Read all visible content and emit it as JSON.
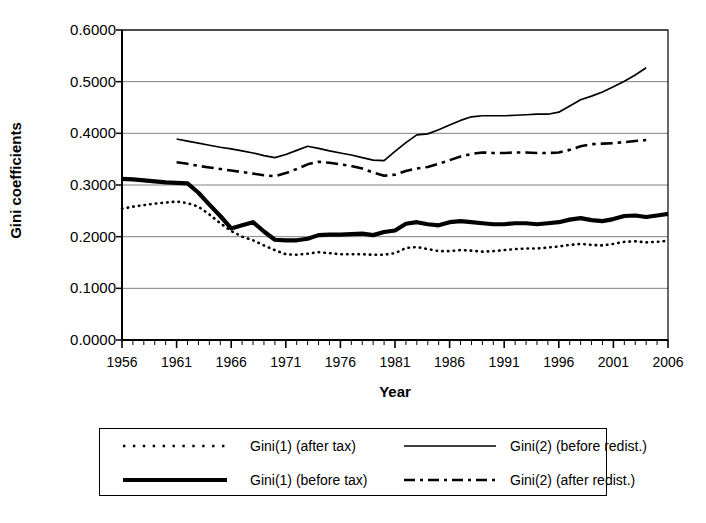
{
  "chart_data": {
    "type": "line",
    "title": "",
    "xlabel": "Year",
    "ylabel": "Gini coefficients",
    "xlim": [
      1956,
      2006
    ],
    "ylim": [
      0.0,
      0.6
    ],
    "grid": true,
    "legend_position": "bottom",
    "x_tick_labels": [
      "1956",
      "1961",
      "1966",
      "1971",
      "1976",
      "1981",
      "1986",
      "1991",
      "1996",
      "2001",
      "2006"
    ],
    "x_ticks": [
      1956,
      1961,
      1966,
      1971,
      1976,
      1981,
      1986,
      1991,
      1996,
      2001,
      2006
    ],
    "y_tick_labels": [
      "0.6000",
      "0.5000",
      "0.4000",
      "0.3000",
      "0.2000",
      "0.1000",
      "0.0000"
    ],
    "y_ticks": [
      0.6,
      0.5,
      0.4,
      0.3,
      0.2,
      0.1,
      0.0
    ],
    "series": [
      {
        "name": "Gini(1) (after tax)",
        "style": "dotted",
        "x": [
          1956,
          1957,
          1958,
          1959,
          1960,
          1961,
          1962,
          1963,
          1964,
          1965,
          1966,
          1967,
          1968,
          1969,
          1970,
          1971,
          1972,
          1973,
          1974,
          1975,
          1976,
          1977,
          1978,
          1979,
          1980,
          1981,
          1982,
          1983,
          1984,
          1985,
          1986,
          1987,
          1988,
          1989,
          1990,
          1991,
          1992,
          1993,
          1994,
          1995,
          1996,
          1997,
          1998,
          1999,
          2000,
          2001,
          2002,
          2003,
          2004,
          2005,
          2006
        ],
        "values": [
          0.254,
          0.258,
          0.261,
          0.264,
          0.266,
          0.268,
          0.265,
          0.258,
          0.243,
          0.226,
          0.211,
          0.2,
          0.193,
          0.183,
          0.174,
          0.166,
          0.165,
          0.167,
          0.17,
          0.168,
          0.166,
          0.166,
          0.166,
          0.165,
          0.165,
          0.168,
          0.178,
          0.18,
          0.176,
          0.172,
          0.172,
          0.174,
          0.173,
          0.171,
          0.172,
          0.174,
          0.176,
          0.177,
          0.177,
          0.179,
          0.181,
          0.184,
          0.186,
          0.184,
          0.183,
          0.186,
          0.19,
          0.191,
          0.189,
          0.19,
          0.192
        ]
      },
      {
        "name": "Gini(1) (before tax)",
        "style": "thick-solid",
        "x": [
          1956,
          1957,
          1958,
          1959,
          1960,
          1961,
          1962,
          1963,
          1964,
          1965,
          1966,
          1967,
          1968,
          1969,
          1970,
          1971,
          1972,
          1973,
          1974,
          1975,
          1976,
          1977,
          1978,
          1979,
          1980,
          1981,
          1982,
          1983,
          1984,
          1985,
          1986,
          1987,
          1988,
          1989,
          1990,
          1991,
          1992,
          1993,
          1994,
          1995,
          1996,
          1997,
          1998,
          1999,
          2000,
          2001,
          2002,
          2003,
          2004,
          2005,
          2006
        ],
        "values": [
          0.312,
          0.311,
          0.309,
          0.307,
          0.305,
          0.304,
          0.303,
          0.285,
          0.262,
          0.24,
          0.216,
          0.222,
          0.228,
          0.21,
          0.194,
          0.193,
          0.193,
          0.196,
          0.203,
          0.204,
          0.204,
          0.205,
          0.206,
          0.203,
          0.209,
          0.212,
          0.225,
          0.228,
          0.224,
          0.222,
          0.228,
          0.23,
          0.228,
          0.226,
          0.224,
          0.224,
          0.226,
          0.226,
          0.224,
          0.226,
          0.228,
          0.233,
          0.236,
          0.232,
          0.23,
          0.234,
          0.24,
          0.241,
          0.238,
          0.241,
          0.244
        ]
      },
      {
        "name": "Gini(2) (before redist.)",
        "style": "thin-solid",
        "x": [
          1961,
          1962,
          1963,
          1964,
          1965,
          1966,
          1967,
          1968,
          1969,
          1970,
          1971,
          1972,
          1973,
          1974,
          1975,
          1976,
          1977,
          1978,
          1979,
          1980,
          1981,
          1982,
          1983,
          1984,
          1985,
          1986,
          1987,
          1988,
          1989,
          1990,
          1991,
          1992,
          1993,
          1994,
          1995,
          1996,
          1997,
          1998,
          1999,
          2000,
          2001,
          2002,
          2003,
          2004
        ],
        "values": [
          0.389,
          0.385,
          0.381,
          0.377,
          0.373,
          0.37,
          0.366,
          0.362,
          0.357,
          0.353,
          0.359,
          0.367,
          0.375,
          0.371,
          0.366,
          0.362,
          0.358,
          0.353,
          0.348,
          0.347,
          0.365,
          0.382,
          0.397,
          0.399,
          0.407,
          0.416,
          0.425,
          0.432,
          0.434,
          0.434,
          0.434,
          0.435,
          0.436,
          0.437,
          0.437,
          0.441,
          0.453,
          0.465,
          0.472,
          0.48,
          0.49,
          0.501,
          0.513,
          0.527
        ]
      },
      {
        "name": "Gini(2) (after redist.)",
        "style": "dash-dot",
        "x": [
          1961,
          1962,
          1963,
          1964,
          1965,
          1966,
          1967,
          1968,
          1969,
          1970,
          1971,
          1972,
          1973,
          1974,
          1975,
          1976,
          1977,
          1978,
          1979,
          1980,
          1981,
          1982,
          1983,
          1984,
          1985,
          1986,
          1987,
          1988,
          1989,
          1990,
          1991,
          1992,
          1993,
          1994,
          1995,
          1996,
          1997,
          1998,
          1999,
          2000,
          2001,
          2002,
          2003,
          2004
        ],
        "values": [
          0.344,
          0.341,
          0.337,
          0.334,
          0.331,
          0.328,
          0.325,
          0.322,
          0.319,
          0.317,
          0.323,
          0.331,
          0.34,
          0.345,
          0.343,
          0.34,
          0.337,
          0.332,
          0.324,
          0.318,
          0.32,
          0.327,
          0.332,
          0.335,
          0.341,
          0.348,
          0.355,
          0.36,
          0.363,
          0.362,
          0.362,
          0.363,
          0.363,
          0.362,
          0.362,
          0.363,
          0.368,
          0.375,
          0.379,
          0.38,
          0.381,
          0.383,
          0.385,
          0.387
        ]
      }
    ]
  },
  "legend": {
    "entries": [
      {
        "label": "Gini(1) (after tax)",
        "style": "dotted"
      },
      {
        "label": "Gini(2) (before redist.)",
        "style": "thin-solid"
      },
      {
        "label": "Gini(1) (before tax)",
        "style": "thick-solid"
      },
      {
        "label": "Gini(2) (after redist.)",
        "style": "dash-dot"
      }
    ]
  },
  "colors": {
    "line": "#000000",
    "grid": "#808080",
    "axis": "#000000",
    "background": "#ffffff"
  }
}
